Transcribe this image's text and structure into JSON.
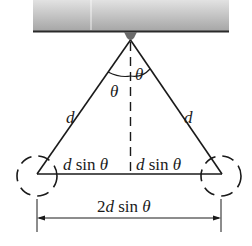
{
  "diagram": {
    "type": "physics-pendulum-geometry",
    "labels": {
      "left_length": "d",
      "right_length": "d",
      "left_angle": "θ",
      "right_angle": "θ",
      "left_half_base": "d sin θ",
      "right_half_base": "d sin θ",
      "total_width": "2d sin θ"
    },
    "colors": {
      "ceiling_top": "#d8d8d8",
      "ceiling_bottom": "#a8a8a8",
      "ceiling_edge": "#2a2a2a",
      "line": "#1a1a1a",
      "pivot": "#6a6a6a"
    }
  }
}
